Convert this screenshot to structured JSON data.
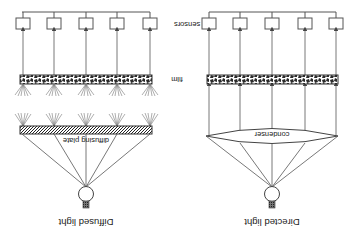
{
  "diagram": {
    "orientation": "rotated 180 degrees",
    "colors": {
      "stroke": "#555555",
      "text": "#222222",
      "texture": "#333333",
      "background": "#ffffff"
    },
    "labels": {
      "sensors": "sensors",
      "film": "film"
    },
    "panels": [
      {
        "id": "diffused",
        "title": "Diffused light",
        "optic_label": "diffusing plate",
        "optic_type": "diffusing plate",
        "sensor_count": 5
      },
      {
        "id": "directed",
        "title": "Directed light",
        "optic_label": "condenser",
        "optic_type": "condenser lens",
        "sensor_count": 5
      }
    ]
  }
}
